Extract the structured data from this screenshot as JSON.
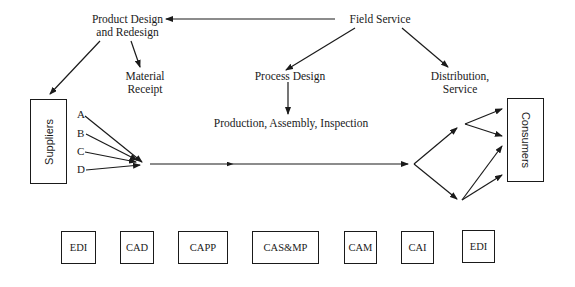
{
  "diagram": {
    "nodes": {
      "product_design": "Product Design",
      "product_redesign": "and Redesign",
      "field_service": "Field Service",
      "material_receipt_1": "Material",
      "material_receipt_2": "Receipt",
      "process_design": "Process Design",
      "distribution_1": "Distribution,",
      "distribution_2": "Service",
      "production": "Production, Assembly, Inspection",
      "suppliers": "Suppliers",
      "consumers": "Consumers"
    },
    "supplier_inputs": [
      "A",
      "B",
      "C",
      "D"
    ],
    "systems": [
      "EDI",
      "CAD",
      "CAPP",
      "CAS&MP",
      "CAM",
      "CAI",
      "EDI"
    ],
    "edges": [
      {
        "from": "Field Service",
        "to": "Product Design and Redesign"
      },
      {
        "from": "Field Service",
        "to": "Process Design"
      },
      {
        "from": "Field Service",
        "to": "Distribution, Service"
      },
      {
        "from": "Product Design and Redesign",
        "to": "Suppliers"
      },
      {
        "from": "Product Design and Redesign",
        "to": "Material Receipt"
      },
      {
        "from": "Process Design",
        "to": "Production, Assembly, Inspection"
      },
      {
        "from": "Suppliers A-D",
        "to": "Material flow"
      },
      {
        "from": "Material flow",
        "to": "Consumers"
      }
    ],
    "colors": {
      "line": "#1a1a1a",
      "background": "#ffffff"
    }
  }
}
